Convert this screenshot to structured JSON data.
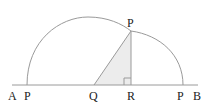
{
  "diagram": {
    "labels": {
      "A": "A",
      "P_left": "P",
      "Q": "Q",
      "R": "R",
      "P_right": "P",
      "B": "B",
      "P_top": "P"
    },
    "colors": {
      "line": "#9a9a9a",
      "triangle_fill": "#ececec",
      "text": "#222222"
    },
    "points": {
      "A": [
        12,
        85
      ],
      "B": [
        198,
        85
      ],
      "P_left": [
        27,
        85
      ],
      "P_right": [
        183,
        85
      ],
      "Q": [
        94,
        85
      ],
      "R": [
        131,
        85
      ],
      "P_top": [
        131,
        31
      ]
    }
  }
}
